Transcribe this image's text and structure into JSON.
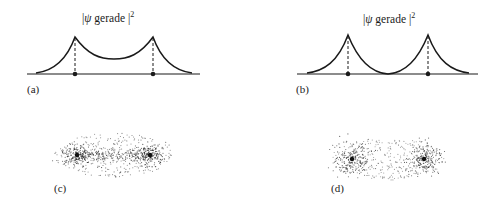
{
  "figure": {
    "panels": [
      {
        "id": "a",
        "label": "(a)",
        "title_prefix": "|",
        "title_psi": "ψ",
        "title_word": " gerade ",
        "title_suffix": "|",
        "title_sup": "2",
        "description": "Probability density |ψ gerade|² along internuclear axis, peaks at the two nuclei with non-zero density between them"
      },
      {
        "id": "b",
        "label": "(b)",
        "title_prefix": "|",
        "title_psi": "ψ",
        "title_word": " gerade ",
        "title_suffix": "|",
        "title_sup": "2",
        "description": "Probability density with peaks at the two nuclei and density dropping to zero at the midpoint"
      },
      {
        "id": "c",
        "label": "(c)",
        "description": "Electron cloud dot density plot, density accumulated between the two nuclei"
      },
      {
        "id": "d",
        "label": "(d)",
        "description": "Electron cloud dot density plot, two separate clouds around nuclei with depleted region between"
      }
    ],
    "colors": {
      "ink": "#1a1a1a",
      "background": "#ffffff"
    }
  }
}
